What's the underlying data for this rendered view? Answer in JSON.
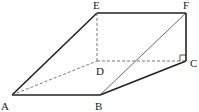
{
  "diagram": {
    "type": "geometry-solid",
    "points": {
      "A": {
        "label": "A",
        "x": 12,
        "y": 95,
        "lx": 1,
        "ly": 110
      },
      "B": {
        "label": "B",
        "x": 100,
        "y": 95,
        "lx": 95,
        "ly": 110
      },
      "C": {
        "label": "C",
        "x": 186,
        "y": 61,
        "lx": 190,
        "ly": 67
      },
      "D": {
        "label": "D",
        "x": 97,
        "y": 61,
        "lx": 96,
        "ly": 75
      },
      "E": {
        "label": "E",
        "x": 97,
        "y": 13,
        "lx": 93,
        "ly": 9
      },
      "F": {
        "label": "F",
        "x": 186,
        "y": 13,
        "lx": 183,
        "ly": 9
      }
    },
    "solid_edges": [
      "AB",
      "BC",
      "CF",
      "EF",
      "AE"
    ],
    "thin_edges": [
      "BF"
    ],
    "dashed_edges": [
      "AD",
      "DC",
      "DE"
    ],
    "right_angle_at": "C",
    "colors": {
      "stroke": "#222222",
      "background": "#ffffff"
    }
  }
}
